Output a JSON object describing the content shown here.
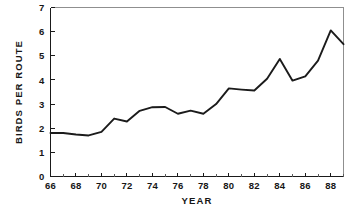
{
  "chart_data": {
    "type": "line",
    "title": "",
    "xlabel": "YEAR",
    "ylabel": "BIRDS PER ROUTE",
    "xlim": [
      66,
      89
    ],
    "ylim": [
      0,
      7
    ],
    "grid": false,
    "legend": false,
    "line_color": "#1b1b1b",
    "axis_color": "#1a1a1a",
    "frame_color": "#8f8f8f",
    "x_tick_labels": [
      "66",
      "68",
      "70",
      "72",
      "74",
      "76",
      "78",
      "80",
      "82",
      "84",
      "86",
      "88"
    ],
    "x_tick_values": [
      66,
      68,
      70,
      72,
      74,
      76,
      78,
      80,
      82,
      84,
      86,
      88
    ],
    "x_minor_ticks": [
      67,
      69,
      71,
      73,
      75,
      77,
      79,
      81,
      83,
      85,
      87,
      89
    ],
    "y_tick_labels": [
      "0",
      "1",
      "2",
      "3",
      "4",
      "5",
      "6",
      "7"
    ],
    "y_tick_values": [
      0,
      1,
      2,
      3,
      4,
      5,
      6,
      7
    ],
    "x": [
      66,
      67,
      68,
      69,
      70,
      71,
      72,
      73,
      74,
      75,
      76,
      77,
      78,
      79,
      80,
      81,
      82,
      83,
      84,
      85,
      86,
      87,
      88,
      89
    ],
    "values": [
      1.8,
      1.8,
      1.74,
      1.7,
      1.85,
      2.4,
      2.28,
      2.72,
      2.87,
      2.88,
      2.6,
      2.73,
      2.6,
      3.0,
      3.65,
      3.6,
      3.56,
      4.05,
      4.87,
      3.97,
      4.15,
      4.8,
      6.05,
      5.48
    ],
    "series": [
      {
        "name": "Birds per route",
        "values": [
          1.8,
          1.8,
          1.74,
          1.7,
          1.85,
          2.4,
          2.28,
          2.72,
          2.87,
          2.88,
          2.6,
          2.73,
          2.6,
          3.0,
          3.65,
          3.6,
          3.56,
          4.05,
          4.87,
          3.97,
          4.15,
          4.8,
          6.05,
          5.48
        ]
      }
    ]
  }
}
